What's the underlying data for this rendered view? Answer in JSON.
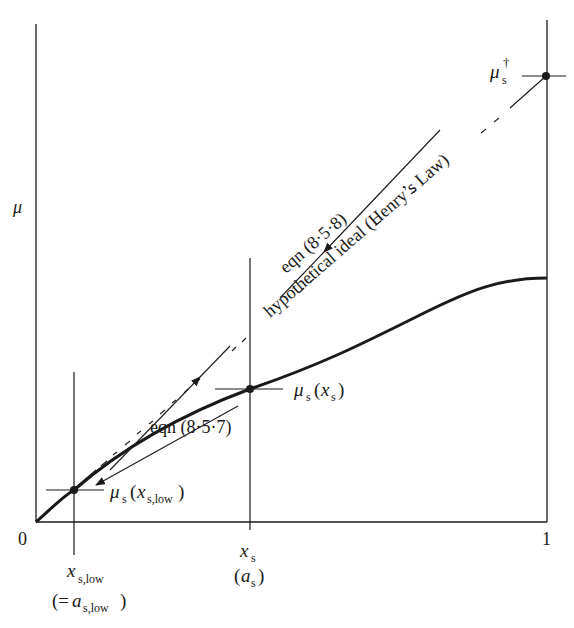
{
  "figure": {
    "y_axis_label": "μ",
    "x_origin_label": "0",
    "x_end_label": "1",
    "points": {
      "mu_dagger": {
        "sym": "μ",
        "sub": "s",
        "sup": "†"
      },
      "mu_xs": {
        "sym": "μ",
        "sub": "s",
        "paren_open": "(",
        "arg": "x",
        "arg_sub": "s",
        "paren_close": ")"
      },
      "mu_xslow": {
        "sym": "μ",
        "sub": "s",
        "paren_open": "(",
        "arg": "x",
        "arg_sub": "s,low",
        "paren_close": ")"
      }
    },
    "x_ticks": {
      "xs": {
        "sym": "x",
        "sub": "s",
        "alt_open": "(",
        "alt_sym": "a",
        "alt_sub": "s",
        "alt_close": ")"
      },
      "xslow": {
        "sym": "x",
        "sub": "s,low",
        "alt_open": "(=",
        "alt_sym": "a",
        "alt_sub": "s,low",
        "alt_close": ")"
      }
    },
    "annotations": {
      "eqn_858": "eqn  (8·5·8)",
      "henry": "hypothetical  ideal  (Henry’s Law)",
      "eqn_857": "eqn  (8·5·7)"
    },
    "colors": {
      "ink": "#1a1a1a",
      "background": "#ffffff"
    }
  }
}
